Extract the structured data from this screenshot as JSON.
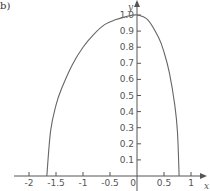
{
  "panel_label": "b)",
  "colors": {
    "axis": "#555555",
    "curve": "#666666",
    "text": "#555555"
  },
  "chart_data": {
    "type": "line",
    "title": "",
    "xlabel": "x",
    "ylabel": "y",
    "xlim": [
      -2.25,
      1.2
    ],
    "ylim": [
      0,
      1.05
    ],
    "grid": false,
    "legend": null,
    "x_ticks": [
      -2,
      -1.5,
      -1,
      -0.5,
      0,
      0.5,
      1
    ],
    "x_tick_labels": [
      "-2",
      "-1.5",
      "-1",
      "-0.5",
      "0",
      "0.5",
      "1"
    ],
    "y_ticks": [
      0.1,
      0.2,
      0.3,
      0.4,
      0.5,
      0.6,
      0.7,
      0.8,
      0.9,
      1.0
    ],
    "y_tick_labels": [
      "0.1",
      "0.2",
      "0.3",
      "0.4",
      "0.5",
      "0.6",
      "0.7",
      "0.8",
      "0.9",
      "1.0"
    ],
    "series": [
      {
        "name": "curve",
        "x": [
          -1.67,
          -1.6,
          -1.5,
          -1.4,
          -1.2,
          -1.0,
          -0.8,
          -0.6,
          -0.4,
          -0.2,
          0.0,
          0.2,
          0.4,
          0.5,
          0.6,
          0.7,
          0.75,
          0.78
        ],
        "y": [
          0.0,
          0.28,
          0.44,
          0.54,
          0.69,
          0.8,
          0.88,
          0.94,
          0.97,
          0.99,
          1.0,
          0.97,
          0.86,
          0.77,
          0.64,
          0.44,
          0.27,
          0.0
        ]
      }
    ]
  }
}
